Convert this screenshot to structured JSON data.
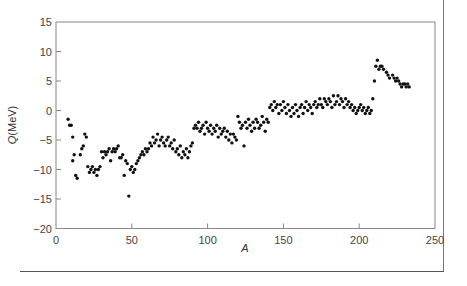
{
  "chart_data": {
    "type": "scatter",
    "title": "",
    "xlabel": "A",
    "ylabel": "Q(MeV)",
    "xlim": [
      0,
      250
    ],
    "ylim": [
      -20,
      15
    ],
    "xticks": [
      0,
      50,
      100,
      150,
      200,
      250
    ],
    "yticks": [
      -20,
      -15,
      -10,
      -5,
      0,
      5,
      10,
      15
    ],
    "grid": false,
    "legend": null,
    "marker_color": "#111111",
    "points": [
      [
        8,
        -1.5
      ],
      [
        9,
        -2.5
      ],
      [
        10,
        -2.5
      ],
      [
        11,
        -4.5
      ],
      [
        11,
        -8.5
      ],
      [
        12,
        -7.5
      ],
      [
        13,
        -11
      ],
      [
        14,
        -11.5
      ],
      [
        16,
        -7.5
      ],
      [
        17,
        -6.5
      ],
      [
        18,
        -6
      ],
      [
        19,
        -4
      ],
      [
        20,
        -4.5
      ],
      [
        21,
        -9.5
      ],
      [
        22,
        -10.5
      ],
      [
        23,
        -10
      ],
      [
        24,
        -9.5
      ],
      [
        25,
        -10.5
      ],
      [
        26,
        -10
      ],
      [
        27,
        -11
      ],
      [
        28,
        -10
      ],
      [
        29,
        -9.5
      ],
      [
        30,
        -7
      ],
      [
        31,
        -8
      ],
      [
        32,
        -7
      ],
      [
        33,
        -7.5
      ],
      [
        34,
        -7
      ],
      [
        35,
        -6.5
      ],
      [
        36,
        -8.5
      ],
      [
        37,
        -7
      ],
      [
        38,
        -6.5
      ],
      [
        39,
        -7
      ],
      [
        40,
        -6.5
      ],
      [
        41,
        -6
      ],
      [
        42,
        -8
      ],
      [
        43,
        -8
      ],
      [
        44,
        -7.5
      ],
      [
        45,
        -11
      ],
      [
        46,
        -8.5
      ],
      [
        47,
        -9
      ],
      [
        48,
        -14.5
      ],
      [
        49,
        -10
      ],
      [
        50,
        -9.5
      ],
      [
        51,
        -10.5
      ],
      [
        52,
        -10
      ],
      [
        53,
        -9
      ],
      [
        54,
        -8.5
      ],
      [
        55,
        -8
      ],
      [
        56,
        -7.5
      ],
      [
        57,
        -7
      ],
      [
        58,
        -7.5
      ],
      [
        59,
        -6.5
      ],
      [
        60,
        -7
      ],
      [
        61,
        -6.5
      ],
      [
        62,
        -5.5
      ],
      [
        63,
        -6
      ],
      [
        64,
        -4.5
      ],
      [
        65,
        -5.5
      ],
      [
        66,
        -5
      ],
      [
        67,
        -4
      ],
      [
        68,
        -6
      ],
      [
        69,
        -5
      ],
      [
        70,
        -4.5
      ],
      [
        71,
        -5.5
      ],
      [
        72,
        -6
      ],
      [
        73,
        -5
      ],
      [
        74,
        -4.5
      ],
      [
        75,
        -6
      ],
      [
        76,
        -5.5
      ],
      [
        77,
        -6.5
      ],
      [
        78,
        -5
      ],
      [
        79,
        -7
      ],
      [
        80,
        -6.5
      ],
      [
        81,
        -7.5
      ],
      [
        82,
        -6
      ],
      [
        83,
        -8
      ],
      [
        84,
        -7
      ],
      [
        85,
        -7.5
      ],
      [
        86,
        -6.5
      ],
      [
        87,
        -8
      ],
      [
        88,
        -7
      ],
      [
        89,
        -6
      ],
      [
        90,
        -5.5
      ],
      [
        91,
        -3
      ],
      [
        92,
        -2.5
      ],
      [
        93,
        -3
      ],
      [
        94,
        -2
      ],
      [
        95,
        -3.5
      ],
      [
        96,
        -3
      ],
      [
        97,
        -2.5
      ],
      [
        98,
        -4
      ],
      [
        99,
        -2
      ],
      [
        100,
        -3
      ],
      [
        101,
        -3.5
      ],
      [
        102,
        -2.5
      ],
      [
        103,
        -4
      ],
      [
        104,
        -3
      ],
      [
        105,
        -3.5
      ],
      [
        106,
        -2.5
      ],
      [
        107,
        -4.5
      ],
      [
        108,
        -3
      ],
      [
        109,
        -4
      ],
      [
        110,
        -3.5
      ],
      [
        111,
        -3
      ],
      [
        112,
        -4.5
      ],
      [
        113,
        -3.5
      ],
      [
        114,
        -5
      ],
      [
        115,
        -4
      ],
      [
        116,
        -5.5
      ],
      [
        117,
        -4
      ],
      [
        118,
        -4.5
      ],
      [
        119,
        -5
      ],
      [
        120,
        -1
      ],
      [
        121,
        -2
      ],
      [
        122,
        -3
      ],
      [
        123,
        -2.5
      ],
      [
        124,
        -6
      ],
      [
        125,
        -2
      ],
      [
        126,
        -3
      ],
      [
        127,
        -1.5
      ],
      [
        128,
        -2.5
      ],
      [
        129,
        -3.5
      ],
      [
        130,
        -2
      ],
      [
        131,
        -3
      ],
      [
        132,
        -1.5
      ],
      [
        133,
        -2
      ],
      [
        134,
        -3
      ],
      [
        135,
        -2.5
      ],
      [
        136,
        -1
      ],
      [
        137,
        -2
      ],
      [
        138,
        -3.5
      ],
      [
        139,
        -1.5
      ],
      [
        140,
        -2
      ],
      [
        141,
        0.5
      ],
      [
        142,
        1
      ],
      [
        143,
        0
      ],
      [
        144,
        1.5
      ],
      [
        145,
        0.5
      ],
      [
        146,
        1
      ],
      [
        147,
        -0.5
      ],
      [
        148,
        1
      ],
      [
        149,
        0
      ],
      [
        150,
        1.5
      ],
      [
        151,
        0.5
      ],
      [
        152,
        -0.5
      ],
      [
        153,
        1
      ],
      [
        154,
        0
      ],
      [
        155,
        -1
      ],
      [
        156,
        0.5
      ],
      [
        157,
        -0.5
      ],
      [
        158,
        1
      ],
      [
        159,
        0
      ],
      [
        160,
        -1
      ],
      [
        161,
        0.5
      ],
      [
        162,
        1
      ],
      [
        163,
        -0.5
      ],
      [
        164,
        0.5
      ],
      [
        165,
        1.5
      ],
      [
        166,
        0
      ],
      [
        167,
        1
      ],
      [
        168,
        0.5
      ],
      [
        169,
        -0.5
      ],
      [
        170,
        1
      ],
      [
        171,
        1.5
      ],
      [
        172,
        0.5
      ],
      [
        173,
        1
      ],
      [
        174,
        2
      ],
      [
        175,
        1
      ],
      [
        176,
        0.5
      ],
      [
        177,
        2
      ],
      [
        178,
        1.5
      ],
      [
        179,
        1
      ],
      [
        180,
        2
      ],
      [
        181,
        1.5
      ],
      [
        182,
        0.5
      ],
      [
        183,
        2.5
      ],
      [
        184,
        1
      ],
      [
        185,
        1.5
      ],
      [
        186,
        2.5
      ],
      [
        187,
        1
      ],
      [
        188,
        2
      ],
      [
        189,
        1.5
      ],
      [
        190,
        0.5
      ],
      [
        191,
        2
      ],
      [
        192,
        1
      ],
      [
        193,
        1.5
      ],
      [
        194,
        0.5
      ],
      [
        195,
        1
      ],
      [
        196,
        0
      ],
      [
        197,
        0.5
      ],
      [
        198,
        -0.5
      ],
      [
        199,
        0
      ],
      [
        200,
        0.5
      ],
      [
        201,
        1
      ],
      [
        202,
        0
      ],
      [
        203,
        0.5
      ],
      [
        204,
        -0.5
      ],
      [
        205,
        0
      ],
      [
        206,
        0.5
      ],
      [
        207,
        -0.5
      ],
      [
        208,
        0
      ],
      [
        209,
        2
      ],
      [
        210,
        5
      ],
      [
        211,
        7.5
      ],
      [
        212,
        8.5
      ],
      [
        213,
        7
      ],
      [
        214,
        7.5
      ],
      [
        215,
        7.5
      ],
      [
        216,
        7
      ],
      [
        218,
        6.5
      ],
      [
        219,
        6
      ],
      [
        220,
        5.5
      ],
      [
        222,
        6
      ],
      [
        223,
        5.5
      ],
      [
        224,
        5
      ],
      [
        225,
        5.5
      ],
      [
        226,
        5
      ],
      [
        227,
        4.5
      ],
      [
        228,
        4
      ],
      [
        229,
        4.5
      ],
      [
        230,
        4.5
      ],
      [
        231,
        4
      ],
      [
        232,
        4.5
      ],
      [
        233,
        4
      ]
    ]
  }
}
